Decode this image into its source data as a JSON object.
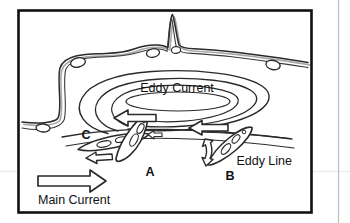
{
  "figure": {
    "background_color": "#ffffff",
    "border_color": "#111111",
    "line_color": "#222222",
    "shore_outline_color": "#333333",
    "shore_shadow_color": "#9a9a9a",
    "faint_rule_color": "#e6e6e6",
    "right_rule_color": "#b9b9b9",
    "labels": {
      "eddy_current": "Eddy Current",
      "eddy_line": "Eddy Line",
      "main_current": "Main Current",
      "kayak_a": "A",
      "kayak_b": "B",
      "kayak_c": "C"
    },
    "arrows": {
      "eddy_upstream_left": "arrow pointing left",
      "eddy_upstream_right": "arrow pointing left",
      "kayak_c_small": "small arrow pointing left",
      "kayak_b_small": "small arrow curving down",
      "main_current": "large arrow pointing right"
    },
    "elements": {
      "shoreline": "rocky shoreline with boulders",
      "eddy_spiral": "concentric eddy swirl lines",
      "eddy_line_curves": "eddy line boundary curves",
      "kayaks": 3
    }
  }
}
